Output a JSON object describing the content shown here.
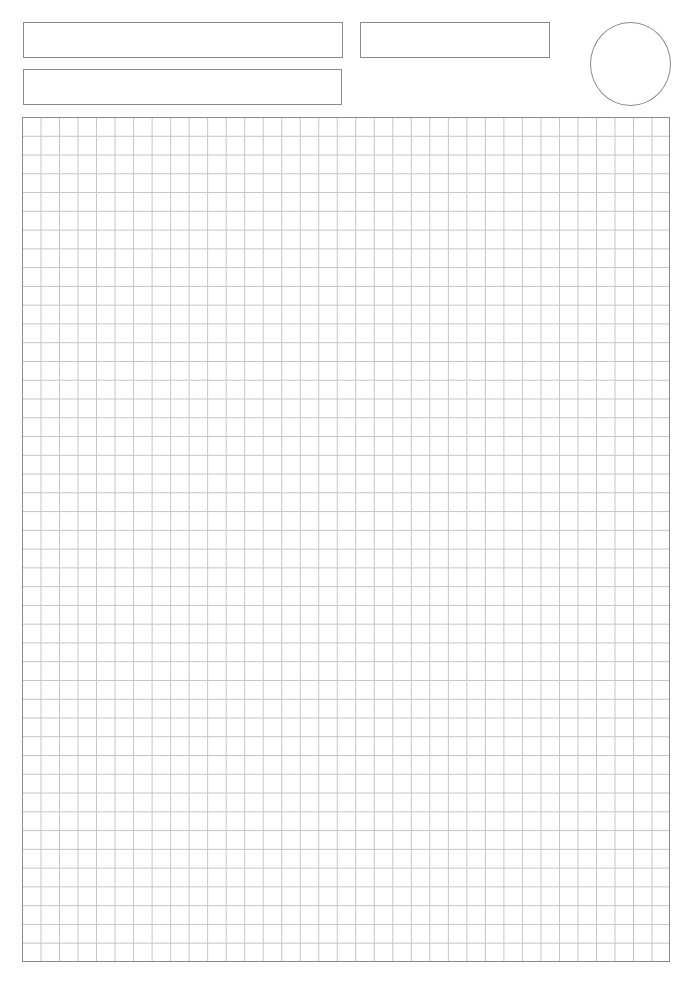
{
  "page": {
    "type": "graph-paper-worksheet",
    "colors": {
      "border": "#8a8a8a",
      "grid_line": "#c4c4c4",
      "background": "#ffffff"
    }
  },
  "header": {
    "fields": [
      {
        "name": "field-1",
        "value": ""
      },
      {
        "name": "field-2",
        "value": ""
      },
      {
        "name": "field-3",
        "value": ""
      }
    ],
    "circle": {
      "value": ""
    }
  },
  "grid": {
    "columns": 35,
    "rows": 45
  }
}
